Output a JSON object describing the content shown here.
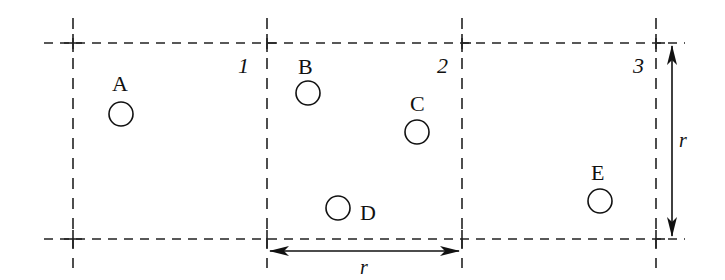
{
  "diagram": {
    "type": "grid-cells-with-points",
    "cells": [
      {
        "id": "cell-1",
        "label": "1"
      },
      {
        "id": "cell-2",
        "label": "2"
      },
      {
        "id": "cell-3",
        "label": "3"
      }
    ],
    "points": [
      {
        "id": "A",
        "label": "A"
      },
      {
        "id": "B",
        "label": "B"
      },
      {
        "id": "C",
        "label": "C"
      },
      {
        "id": "D",
        "label": "D"
      },
      {
        "id": "E",
        "label": "E"
      }
    ],
    "dimensions": {
      "horizontal": {
        "label": "r"
      },
      "vertical": {
        "label": "r"
      }
    }
  }
}
